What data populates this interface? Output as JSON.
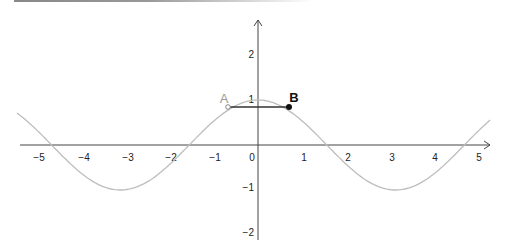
{
  "chart_data": {
    "type": "line",
    "title": "",
    "xlabel": "",
    "ylabel": "",
    "xlim": [
      -5.5,
      5.3
    ],
    "ylim": [
      -2.3,
      2.5
    ],
    "grid": false,
    "x_ticks": [
      -5,
      -4,
      -3,
      -2,
      -1,
      0,
      1,
      2,
      3,
      4,
      5
    ],
    "y_ticks": [
      2,
      1,
      -1,
      -2
    ],
    "x_tick_labels": [
      "−5",
      "−4",
      "−3",
      "−2",
      "−1",
      "0",
      "1",
      "2",
      "3",
      "4",
      "5"
    ],
    "y_tick_labels": [
      "2",
      "1",
      "−1",
      "−2"
    ],
    "series": [
      {
        "name": "f(x) = cos(x)",
        "color": "#bdbdbd",
        "x_range": [
          -5.5,
          5.3
        ]
      }
    ],
    "points": [
      {
        "name": "A",
        "x": -0.7,
        "y": 0.76,
        "style": "open",
        "color": "#999999"
      },
      {
        "name": "B",
        "x": 0.7,
        "y": 0.76,
        "style": "filled",
        "color": "#111111"
      }
    ],
    "segments": [
      {
        "from": "A",
        "to": "B",
        "color": "#333333"
      }
    ]
  },
  "labels": {
    "point_a": "A",
    "point_b": "B",
    "x_ticks": [
      "−5",
      "−4",
      "−3",
      "−2",
      "−1",
      "0",
      "1",
      "2",
      "3",
      "4",
      "5"
    ],
    "y_ticks": [
      "2",
      "1",
      "−1",
      "−2"
    ]
  }
}
